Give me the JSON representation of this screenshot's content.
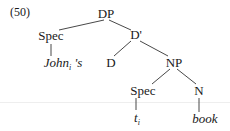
{
  "example_number": "(50)",
  "tree": {
    "root": "DP",
    "nodes": {
      "dp": "DP",
      "spec_top": "Spec",
      "dbar": "D'",
      "johns_word": "John",
      "johns_index": "i",
      "johns_suffix": " 's",
      "d": "D",
      "np": "NP",
      "spec_lower": "Spec",
      "n": "N",
      "trace_word": "t",
      "trace_index": "i",
      "book": "book"
    },
    "edges": [
      [
        "DP",
        "Spec"
      ],
      [
        "DP",
        "D'"
      ],
      [
        "Spec",
        "John_i 's"
      ],
      [
        "D'",
        "D"
      ],
      [
        "D'",
        "NP"
      ],
      [
        "NP",
        "Spec"
      ],
      [
        "NP",
        "N"
      ],
      [
        "Spec",
        "t_i"
      ],
      [
        "N",
        "book"
      ]
    ]
  }
}
